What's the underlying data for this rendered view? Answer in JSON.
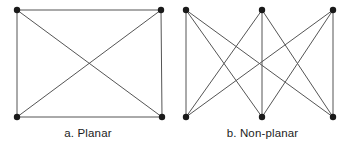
{
  "figure": {
    "background_color": "#ffffff",
    "width": 349,
    "height": 149,
    "edge_color": "#555555",
    "node_color": "#1a1a1a",
    "node_radius": 3.2,
    "edge_width": 1
  },
  "panels": [
    {
      "id": "planar",
      "caption": "a. Planar",
      "graph_name": "K4",
      "node_count": 4,
      "edge_count": 6,
      "nodes": [
        {
          "id": "tl",
          "label": "top-left",
          "x": 17,
          "y": 10
        },
        {
          "id": "tr",
          "label": "top-right",
          "x": 161,
          "y": 10
        },
        {
          "id": "bl",
          "label": "bottom-left",
          "x": 17,
          "y": 117
        },
        {
          "id": "br",
          "label": "bottom-right",
          "x": 162,
          "y": 117
        }
      ],
      "edges": [
        {
          "from": "tl",
          "to": "tr"
        },
        {
          "from": "tl",
          "to": "bl"
        },
        {
          "from": "tr",
          "to": "br"
        },
        {
          "from": "bl",
          "to": "br"
        },
        {
          "from": "tl",
          "to": "br"
        },
        {
          "from": "tr",
          "to": "bl"
        }
      ]
    },
    {
      "id": "nonplanar",
      "caption": "b. Non-planar",
      "graph_name": "K3,3",
      "node_count": 6,
      "edge_count": 9,
      "nodes": [
        {
          "id": "t1",
          "label": "top-left",
          "x": 186,
          "y": 10
        },
        {
          "id": "t2",
          "label": "top-center",
          "x": 262,
          "y": 10
        },
        {
          "id": "t3",
          "label": "top-right",
          "x": 333,
          "y": 10
        },
        {
          "id": "b1",
          "label": "bottom-left",
          "x": 186,
          "y": 117
        },
        {
          "id": "b2",
          "label": "bottom-center",
          "x": 262,
          "y": 117
        },
        {
          "id": "b3",
          "label": "bottom-right",
          "x": 333,
          "y": 117
        }
      ],
      "edges": [
        {
          "from": "t1",
          "to": "b1"
        },
        {
          "from": "t1",
          "to": "b2"
        },
        {
          "from": "t1",
          "to": "b3"
        },
        {
          "from": "t2",
          "to": "b1"
        },
        {
          "from": "t2",
          "to": "b2"
        },
        {
          "from": "t2",
          "to": "b3"
        },
        {
          "from": "t3",
          "to": "b1"
        },
        {
          "from": "t3",
          "to": "b2"
        },
        {
          "from": "t3",
          "to": "b3"
        }
      ]
    }
  ]
}
